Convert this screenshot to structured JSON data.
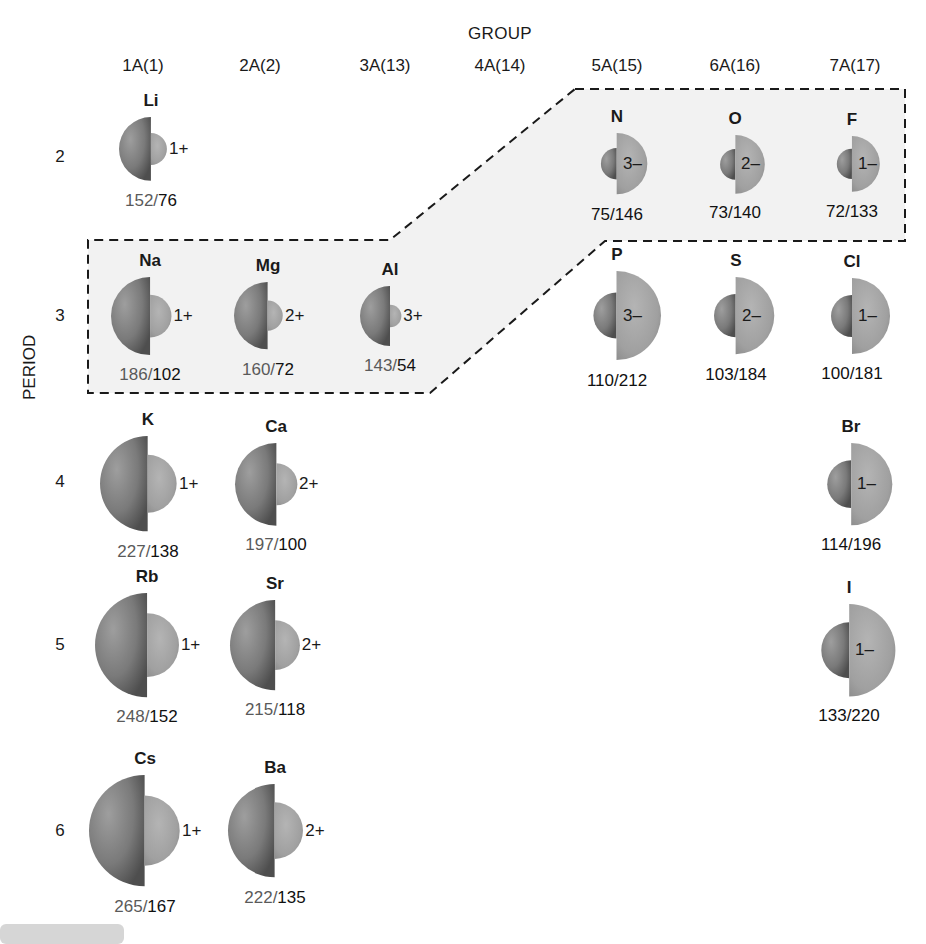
{
  "header": {
    "group_title": "GROUP",
    "period_title": "PERIOD",
    "groups": [
      {
        "label": "1A(1)",
        "x": 143
      },
      {
        "label": "2A(2)",
        "x": 260
      },
      {
        "label": "3A(13)",
        "x": 385
      },
      {
        "label": "4A(14)",
        "x": 500
      },
      {
        "label": "5A(15)",
        "x": 617
      },
      {
        "label": "6A(16)",
        "x": 735
      },
      {
        "label": "7A(17)",
        "x": 855
      }
    ],
    "periods": [
      {
        "label": "2",
        "y": 157
      },
      {
        "label": "3",
        "y": 316
      },
      {
        "label": "4",
        "y": 482
      },
      {
        "label": "5",
        "y": 645
      },
      {
        "label": "6",
        "y": 831
      }
    ]
  },
  "colors": {
    "atom_sphere": "#7d7d7d",
    "ion_sphere": "#a4a4a4",
    "highlight_fill": "#f2f2f2",
    "dash_stroke": "#1a1a1a",
    "atom_radius_text": "#5a5a5a",
    "ion_radius_text": "#111111"
  },
  "elements": [
    {
      "symbol": "Li",
      "type": "cation",
      "charge": "1+",
      "atom_radius": "152",
      "ion_radius": "76",
      "cx": 151,
      "cy": 149
    },
    {
      "symbol": "N",
      "type": "anion",
      "charge": "3–",
      "atom_radius": "75",
      "ion_radius": "146",
      "cx": 617,
      "cy": 164
    },
    {
      "symbol": "O",
      "type": "anion",
      "charge": "2–",
      "atom_radius": "73",
      "ion_radius": "140",
      "cx": 735,
      "cy": 164
    },
    {
      "symbol": "F",
      "type": "anion",
      "charge": "1–",
      "atom_radius": "72",
      "ion_radius": "133",
      "cx": 852,
      "cy": 164
    },
    {
      "symbol": "Na",
      "type": "cation",
      "charge": "1+",
      "atom_radius": "186",
      "ion_radius": "102",
      "cx": 150,
      "cy": 316
    },
    {
      "symbol": "Mg",
      "type": "cation",
      "charge": "2+",
      "atom_radius": "160",
      "ion_radius": "72",
      "cx": 268,
      "cy": 316
    },
    {
      "symbol": "Al",
      "type": "cation",
      "charge": "3+",
      "atom_radius": "143",
      "ion_radius": "54",
      "cx": 390,
      "cy": 316
    },
    {
      "symbol": "P",
      "type": "anion",
      "charge": "3–",
      "atom_radius": "110",
      "ion_radius": "212",
      "cx": 617,
      "cy": 316
    },
    {
      "symbol": "S",
      "type": "anion",
      "charge": "2–",
      "atom_radius": "103",
      "ion_radius": "184",
      "cx": 736,
      "cy": 316
    },
    {
      "symbol": "Cl",
      "type": "anion",
      "charge": "1–",
      "atom_radius": "100",
      "ion_radius": "181",
      "cx": 852,
      "cy": 316
    },
    {
      "symbol": "K",
      "type": "cation",
      "charge": "1+",
      "atom_radius": "227",
      "ion_radius": "138",
      "cx": 148,
      "cy": 484
    },
    {
      "symbol": "Ca",
      "type": "cation",
      "charge": "2+",
      "atom_radius": "197",
      "ion_radius": "100",
      "cx": 276,
      "cy": 484
    },
    {
      "symbol": "Br",
      "type": "anion",
      "charge": "1–",
      "atom_radius": "114",
      "ion_radius": "196",
      "cx": 851,
      "cy": 484
    },
    {
      "symbol": "Rb",
      "type": "cation",
      "charge": "1+",
      "atom_radius": "248",
      "ion_radius": "152",
      "cx": 147,
      "cy": 645
    },
    {
      "symbol": "Sr",
      "type": "cation",
      "charge": "2+",
      "atom_radius": "215",
      "ion_radius": "118",
      "cx": 275,
      "cy": 645
    },
    {
      "symbol": "I",
      "type": "anion",
      "charge": "1–",
      "atom_radius": "133",
      "ion_radius": "220",
      "cx": 849,
      "cy": 650
    },
    {
      "symbol": "Cs",
      "type": "cation",
      "charge": "1+",
      "atom_radius": "265",
      "ion_radius": "167",
      "cx": 145,
      "cy": 831
    },
    {
      "symbol": "Ba",
      "type": "cation",
      "charge": "2+",
      "atom_radius": "222",
      "ion_radius": "135",
      "cx": 275,
      "cy": 831
    }
  ],
  "highlight_region": {
    "description": "Dashed outline grouping Na, Mg, Al, N, O, F (isoelectronic with Ne)",
    "points": "575,89 905,89 905,241 605,241 430,393 88,393 88,240 390,240"
  },
  "scale_px_per_pm": 0.21
}
